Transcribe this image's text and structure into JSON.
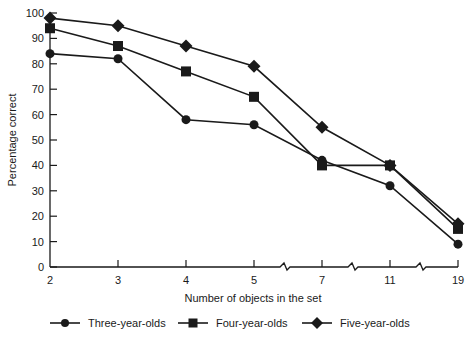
{
  "chart_data": {
    "type": "line",
    "title": "",
    "xlabel": "Number of objects in the set",
    "ylabel": "Percentage correct",
    "x": [
      "2",
      "3",
      "4",
      "5",
      "7",
      "11",
      "19"
    ],
    "x_axis_breaks_between": [
      [
        "5",
        "7"
      ],
      [
        "7",
        "11"
      ],
      [
        "11",
        "19"
      ]
    ],
    "ylim": [
      0,
      100
    ],
    "yticks": [
      0,
      10,
      20,
      30,
      40,
      50,
      60,
      70,
      80,
      90,
      100
    ],
    "grid": false,
    "legend_position": "bottom",
    "series": [
      {
        "name": "Three-year-olds",
        "marker": "circle",
        "values": [
          84,
          82,
          58,
          56,
          42,
          32,
          9
        ]
      },
      {
        "name": "Four-year-olds",
        "marker": "square",
        "values": [
          94,
          87,
          77,
          67,
          40,
          40,
          15
        ]
      },
      {
        "name": "Five-year-olds",
        "marker": "diamond",
        "values": [
          98,
          95,
          87,
          79,
          55,
          40,
          17
        ]
      }
    ]
  },
  "colors": {
    "line": "#1a1a1a",
    "background": "#ffffff"
  }
}
